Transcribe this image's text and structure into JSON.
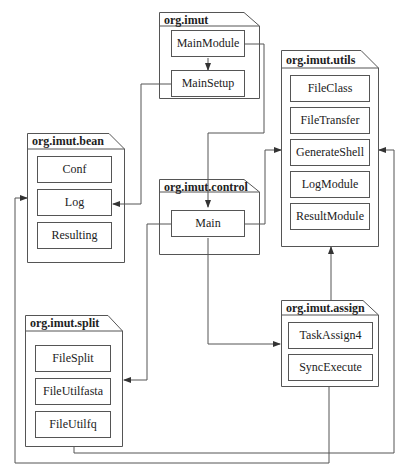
{
  "diagram": {
    "type": "uml-package-dependency",
    "packages": [
      {
        "id": "imut",
        "name": "org.imut",
        "classes": [
          "MainModule",
          "MainSetup"
        ]
      },
      {
        "id": "utils",
        "name": "org.imut.utils",
        "classes": [
          "FileClass",
          "FileTransfer",
          "GenerateShell",
          "LogModule",
          "ResultModule"
        ]
      },
      {
        "id": "bean",
        "name": "org.imut.bean",
        "classes": [
          "Conf",
          "Log",
          "Resulting"
        ]
      },
      {
        "id": "control",
        "name": "org.imut.control",
        "classes": [
          "Main"
        ]
      },
      {
        "id": "split",
        "name": "org.imut.split",
        "classes": [
          "FileSplit",
          "FileUtilfasta",
          "FileUtilfq"
        ]
      },
      {
        "id": "assign",
        "name": "org.imut.assign",
        "classes": [
          "TaskAssign4",
          "SyncExecute"
        ]
      }
    ],
    "edges": [
      {
        "from": "MainModule",
        "to": "MainSetup"
      },
      {
        "from": "MainSetup",
        "to": "Conf"
      },
      {
        "from": "MainModule",
        "to": "Main"
      },
      {
        "from": "Main",
        "to": "org.imut.utils"
      },
      {
        "from": "Main",
        "to": "org.imut.split"
      },
      {
        "from": "Main",
        "to": "org.imut.assign"
      },
      {
        "from": "org.imut.assign",
        "to": "org.imut.utils"
      },
      {
        "from": "org.imut.split",
        "to": "org.imut.utils"
      },
      {
        "from": "org.imut.assign",
        "to": "org.imut.bean"
      }
    ]
  },
  "colors": {
    "line": "#555555",
    "background": "#ffffff",
    "text": "#222222"
  }
}
